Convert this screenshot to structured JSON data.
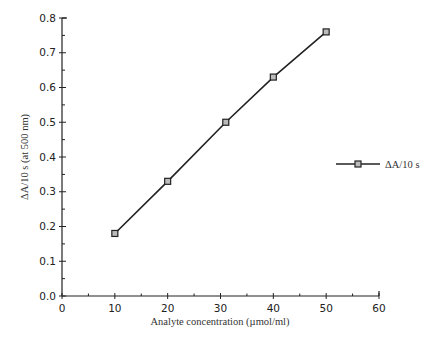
{
  "chart_data": {
    "type": "line",
    "title": "",
    "xlabel": "Analyte concentration (µmol/ml)",
    "ylabel": "ΔA/10 s (at 500 nm)",
    "xlim": [
      0,
      60
    ],
    "ylim": [
      0,
      0.8
    ],
    "xticks": [
      0,
      10,
      20,
      30,
      40,
      50,
      60
    ],
    "xtick_labels": [
      "0",
      "10",
      "20",
      "30",
      "40",
      "50",
      "60"
    ],
    "yticks": [
      0,
      0.1,
      0.2,
      0.3,
      0.4,
      0.5,
      0.6,
      0.7,
      0.8
    ],
    "ytick_labels": [
      "0.0",
      "0.1",
      "0.2",
      "0.3",
      "0.4",
      "0.5",
      "0.6",
      "0.7",
      "0.8"
    ],
    "x_minor_step": 5,
    "y_minor_step": 0.05,
    "grid": false,
    "legend_position": "right",
    "series": [
      {
        "name": "ΔA/10 s",
        "marker": "square",
        "color": "#222222",
        "x": [
          10,
          20,
          31,
          40,
          50
        ],
        "values": [
          0.18,
          0.33,
          0.5,
          0.63,
          0.76
        ]
      }
    ]
  },
  "legend": {
    "items": [
      {
        "label": "ΔA/10 s"
      }
    ]
  }
}
